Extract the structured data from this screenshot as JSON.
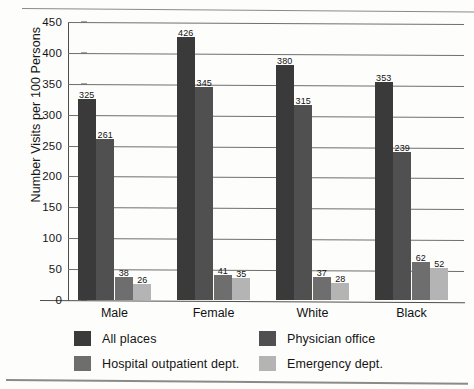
{
  "chart_data": {
    "type": "bar",
    "title": "",
    "xlabel": "",
    "ylabel": "Number Visits per 100 Persons",
    "ylim": [
      0,
      450
    ],
    "ytick_step": 50,
    "yticks": [
      0,
      50,
      100,
      150,
      200,
      250,
      300,
      350,
      400,
      450
    ],
    "ytick_labels": [
      "0",
      "50",
      "100",
      "150",
      "200",
      "250",
      "300",
      "350",
      "400",
      "450"
    ],
    "grid": true,
    "legend_position": "below-plot",
    "categories": [
      "Male",
      "Female",
      "White",
      "Black"
    ],
    "series": [
      {
        "name": "All places",
        "color": "#3a3a3a",
        "values": [
          325,
          426,
          380,
          353
        ]
      },
      {
        "name": "Physician office",
        "color": "#505050",
        "values": [
          261,
          345,
          315,
          239
        ]
      },
      {
        "name": "Hospital outpatient dept.",
        "color": "#6e6e6e",
        "values": [
          38,
          41,
          37,
          62
        ]
      },
      {
        "name": "Emergency dept.",
        "color": "#b4b4b4",
        "values": [
          26,
          35,
          28,
          52
        ]
      }
    ],
    "data_labels": [
      [
        "325",
        "261",
        "38",
        "26"
      ],
      [
        "426",
        "345",
        "41",
        "35"
      ],
      [
        "380",
        "315",
        "37",
        "28"
      ],
      [
        "353",
        "239",
        "62",
        "52"
      ]
    ]
  },
  "legend": {
    "items": [
      {
        "label": "All places"
      },
      {
        "label": "Physician office"
      },
      {
        "label": "Hospital outpatient dept."
      },
      {
        "label": "Emergency dept."
      }
    ]
  },
  "colors": {
    "series_1": "#3a3a3a",
    "series_2": "#505050",
    "series_3": "#6e6e6e",
    "series_4": "#b4b4b4",
    "gridline": "#6f6f6d",
    "axis": "#4e4e4c",
    "text": "#141414",
    "background": "#fdfdfc"
  }
}
